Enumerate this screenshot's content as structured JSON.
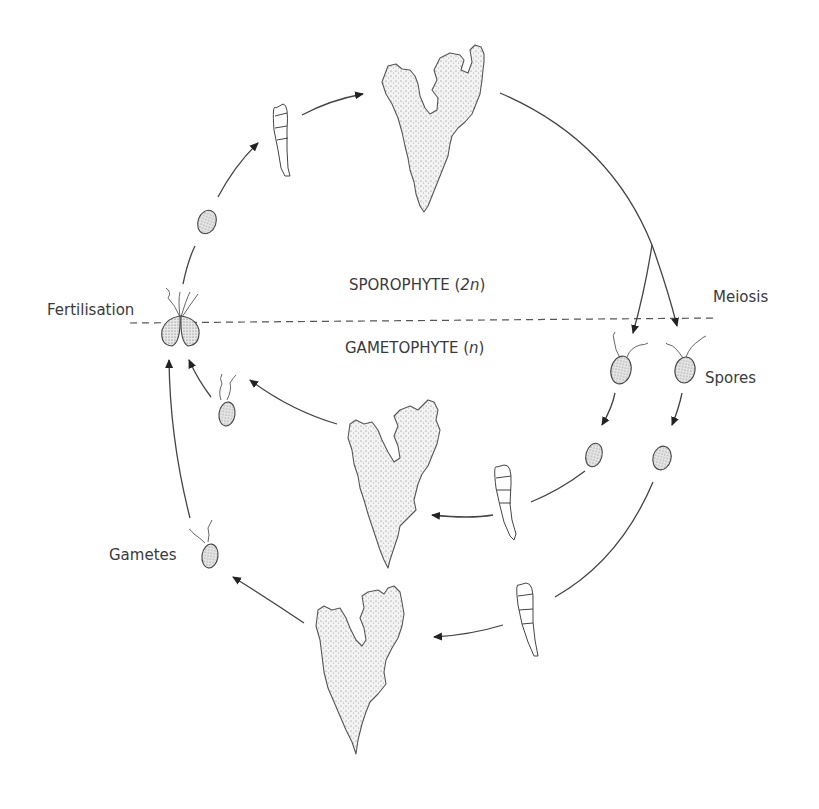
{
  "diagram": {
    "type": "life-cycle",
    "labels": {
      "fertilisation": "Fertilisation",
      "meiosis": "Meiosis",
      "spores": "Spores",
      "gametes": "Gametes",
      "sporophyte_name": "SPOROPHYTE (",
      "sporophyte_ploidy": "2n",
      "sporophyte_close": ")",
      "gametophyte_name": "GAMETOPHYTE (",
      "gametophyte_ploidy": "n",
      "gametophyte_close": ")"
    },
    "phases": [
      {
        "name": "Sporophyte",
        "ploidy": "2n",
        "region": "above dashed line"
      },
      {
        "name": "Gametophyte",
        "ploidy": "n",
        "region": "below dashed line"
      }
    ],
    "stages": [
      "zygote (fertilisation)",
      "zygote cell",
      "germling",
      "sporophyte thallus",
      "meiosis",
      "two flagellated spores",
      "settled spores",
      "germlings",
      "two gametophyte thalli",
      "two flagellated gametes",
      "fertilisation"
    ],
    "colors": {
      "line": "#444444",
      "text": "#3a3a3a",
      "background": "#ffffff"
    }
  }
}
